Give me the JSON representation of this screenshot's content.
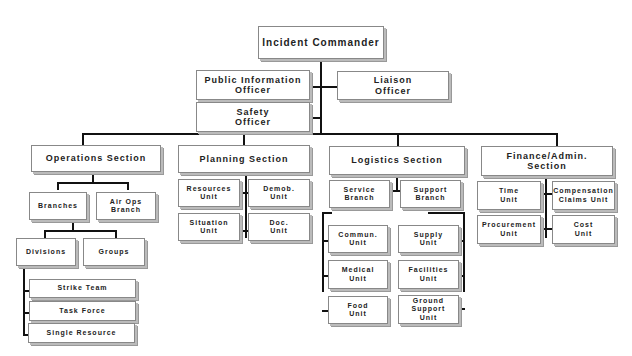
{
  "command": {
    "incident_commander": "Incident Commander",
    "public_information_officer": "Public Information\nOfficer",
    "liaison_officer": "Liaison\nOfficer",
    "safety_officer": "Safety\nOfficer"
  },
  "sections": {
    "operations": {
      "label": "Operations Section",
      "branches": "Branches",
      "air_ops_branch": "Air Ops\nBranch",
      "divisions": "Divisions",
      "groups": "Groups",
      "resources": [
        "Strike Team",
        "Task Force",
        "Single Resource"
      ]
    },
    "planning": {
      "label": "Planning Section",
      "units": [
        "Resources\nUnit",
        "Demob.\nUnit",
        "Situation\nUnit",
        "Doc.\nUnit"
      ]
    },
    "logistics": {
      "label": "Logistics Section",
      "service_branch": "Service\nBranch",
      "support_branch": "Support\nBranch",
      "service_units": [
        "Commun.\nUnit",
        "Medical\nUnit",
        "Food\nUnit"
      ],
      "support_units": [
        "Supply\nUnit",
        "Facilities\nUnit",
        "Ground\nSupport\nUnit"
      ]
    },
    "finance": {
      "label": "Finance/Admin.\nSection",
      "units": [
        "Time\nUnit",
        "Compensation\nClaims Unit",
        "Procurement\nUnit",
        "Cost\nUnit"
      ]
    }
  }
}
